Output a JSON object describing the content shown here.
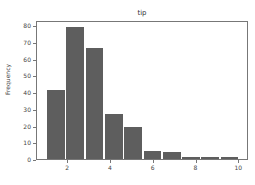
{
  "chart_data": {
    "type": "bar",
    "title": "tip",
    "xlabel": "",
    "ylabel": "Frequency",
    "bin_edges": [
      1.0,
      1.9,
      2.8,
      3.7,
      4.6,
      5.5,
      6.4,
      7.3,
      8.2,
      9.1,
      10.0
    ],
    "categories": [
      "1.0-1.9",
      "1.9-2.8",
      "2.8-3.7",
      "3.7-4.6",
      "4.6-5.5",
      "5.5-6.4",
      "6.4-7.3",
      "7.3-8.2",
      "8.2-9.1",
      "9.1-10.0"
    ],
    "values": [
      41,
      79,
      66,
      27,
      19,
      5,
      4,
      1,
      1,
      1
    ],
    "xlim": [
      0.55,
      10.45
    ],
    "ylim": [
      0,
      83
    ],
    "xticks": [
      2,
      4,
      6,
      8,
      10
    ],
    "yticks": [
      0,
      10,
      20,
      30,
      40,
      50,
      60,
      70,
      80
    ],
    "grid": false,
    "bar_color": "#5e5e5e"
  }
}
